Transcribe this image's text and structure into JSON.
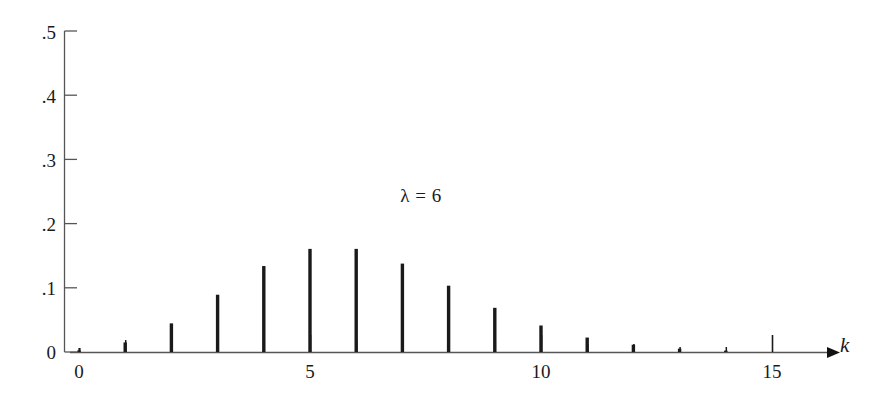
{
  "chart_data": {
    "type": "bar",
    "title": "",
    "subtitle": "",
    "xlabel": "k",
    "ylabel": "",
    "annotation": "λ = 6",
    "grid": false,
    "legend": false,
    "xlim": [
      0,
      15.6
    ],
    "ylim": [
      0,
      0.5
    ],
    "x_ticks": [
      0,
      1,
      2,
      3,
      4,
      5,
      6,
      7,
      8,
      9,
      10,
      11,
      12,
      13,
      14,
      15
    ],
    "x_tick_labels": [
      "0",
      "",
      "",
      "",
      "",
      "5",
      "",
      "",
      "",
      "",
      "10",
      "",
      "",
      "",
      "",
      "15"
    ],
    "y_ticks": [
      0,
      0.1,
      0.2,
      0.3,
      0.4,
      0.5
    ],
    "y_tick_labels": [
      "0",
      ".1",
      ".2",
      ".3",
      ".4",
      ".5"
    ],
    "categories": [
      0,
      1,
      2,
      3,
      4,
      5,
      6,
      7,
      8,
      9,
      10,
      11,
      12,
      13,
      14,
      15
    ],
    "values": [
      0.0025,
      0.0149,
      0.0446,
      0.0892,
      0.1339,
      0.1606,
      0.1606,
      0.1377,
      0.1033,
      0.0688,
      0.0413,
      0.0225,
      0.0113,
      0.0052,
      0.0022,
      0.0009
    ],
    "series": [
      {
        "name": "Poisson pmf",
        "values": [
          0.0025,
          0.0149,
          0.0446,
          0.0892,
          0.1339,
          0.1606,
          0.1606,
          0.1377,
          0.1033,
          0.0688,
          0.0413,
          0.0225,
          0.0113,
          0.0052,
          0.0022,
          0.0009
        ]
      }
    ],
    "colors": {
      "bar": "#1a1a1a",
      "axis": "#555555",
      "text": "#1a1a1a",
      "background": "#ffffff"
    }
  },
  "axes": {
    "x_axis_name": "k-axis",
    "y_axis_name": "probability-axis",
    "arrow": "right-arrow"
  }
}
